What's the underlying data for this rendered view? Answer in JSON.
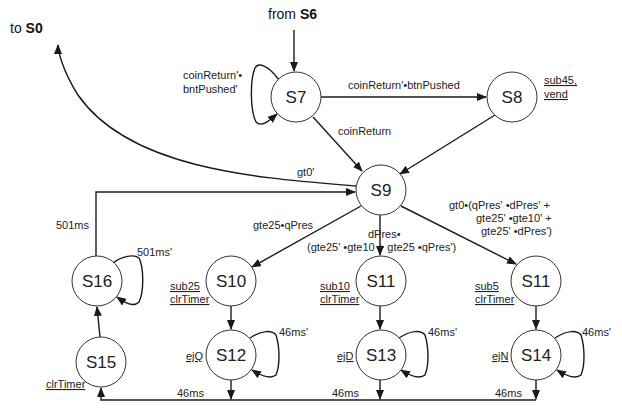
{
  "external": {
    "from_prefix": "from ",
    "from_state": "S6",
    "to_prefix": "to ",
    "to_state": "S0"
  },
  "states": {
    "s7": "S7",
    "s8": "S8",
    "s9": "S9",
    "s10": "S10",
    "s11a": "S11",
    "s11b": "S11",
    "s12": "S12",
    "s13": "S13",
    "s14": "S14",
    "s15": "S15",
    "s16": "S16"
  },
  "actions": {
    "s8_line1": "sub45,",
    "s8_line2": "vend",
    "s10_line1": "sub25",
    "s10_line2": "clrTimer",
    "s11a_line1": "sub10",
    "s11a_line2": "clrTimer",
    "s11b_line1": "sub5",
    "s11b_line2": "clrTimer",
    "s12": "ejQ",
    "s13": "ejD",
    "s14": "ejN",
    "s15": "clrTimer"
  },
  "transitions": {
    "s7_self_line1": "coinReturn'•",
    "s7_self_line2": "bntPushed'",
    "s7_s8": "coinReturn'•btnPushed",
    "s7_s9": "coinReturn",
    "s9_s0": "gt0'",
    "s16_s9": "501ms",
    "s16_self": "501ms'",
    "s9_s10": "gte25•qPres",
    "s9_s11a_line1": "dPres•",
    "s9_s11a_line2": "(gte25' •gte10 + gte25 •qPres')",
    "s9_s11b_line1": "gt0•(qPres' •dPres' +",
    "s9_s11b_line2": "gte25' •gte10' +",
    "s9_s11b_line3": "gte25' •dPres')",
    "s12_self": "46ms'",
    "s13_self": "46ms'",
    "s14_self": "46ms'",
    "s12_out": "46ms",
    "s13_out": "46ms",
    "s14_out": "46ms"
  }
}
